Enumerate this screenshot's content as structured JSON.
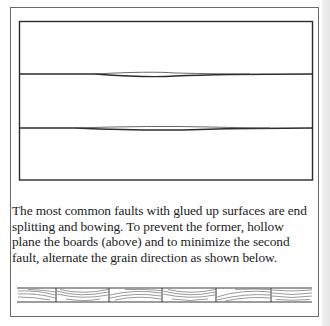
{
  "figure": {
    "top_illustration": {
      "description": "three glued-up boards with hollow-planed joints",
      "boards": 3,
      "seams": 2
    },
    "caption": "The most common faults with glued up surfaces are end splitting and bowing. To prevent the former, hollow plane the boards (above) and to minimize the second fault, alternate the grain direction as shown below.",
    "bottom_illustration": {
      "description": "end grain of boards with alternating growth ring direction",
      "segments": 6
    }
  }
}
